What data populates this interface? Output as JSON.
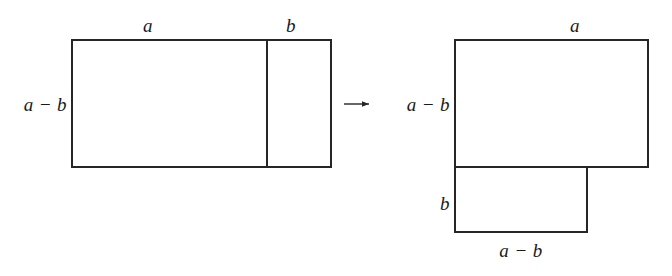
{
  "figure": {
    "stroke_color": "#262626",
    "fill_color": "#ffffff",
    "background_color": "#ffffff",
    "stroke_width": 2
  },
  "left_figure": {
    "name": "original-rectangle",
    "top_label_a": "a",
    "top_label_b": "b",
    "left_label": "a − b",
    "geometry": {
      "x": 72,
      "y": 40,
      "width": 259,
      "height": 127,
      "divider_x": 267
    }
  },
  "transform_arrow": {
    "glyph": "⟶",
    "name": "transformation-arrow"
  },
  "right_figure": {
    "name": "rearranged-lshape",
    "top_label_a": "a",
    "left_label_upper": "a − b",
    "left_label_lower": "b",
    "bottom_label": "a − b",
    "geometry": {
      "upper_x": 455,
      "upper_y": 40,
      "upper_width": 193,
      "upper_height": 127,
      "lower_x": 455,
      "lower_y": 167,
      "lower_width": 132,
      "lower_height": 65
    }
  },
  "labels": {
    "a": "a",
    "b": "b",
    "a_minus_b": "a − b"
  }
}
